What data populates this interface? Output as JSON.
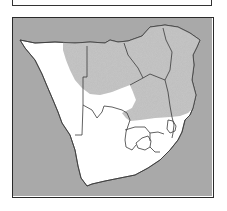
{
  "map": {
    "region": "Southern Africa",
    "legend": [],
    "colors": {
      "ocean": "#a9a9a9",
      "land": "#ffffff",
      "range_shading": "#bdbdbd",
      "border": "#3a3a3a",
      "frame": "#2a2a2a"
    },
    "layers": [
      {
        "name": "ocean"
      },
      {
        "name": "land"
      },
      {
        "name": "distribution-range-shaded"
      },
      {
        "name": "country-borders"
      }
    ]
  },
  "caption_box": {
    "text": ""
  }
}
